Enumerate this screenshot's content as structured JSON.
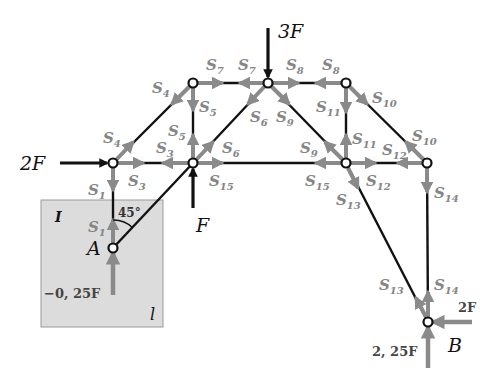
{
  "diagram": {
    "type": "truss free-body diagram",
    "colors": {
      "member": "#111111",
      "force_arrow": "#8a8a8a",
      "load": "#111111",
      "cutout_box": "#dcdcdc"
    },
    "nodes": [
      {
        "id": "A",
        "label": "A",
        "x": 113,
        "y": 248
      },
      {
        "id": "N1",
        "x": 113,
        "y": 163
      },
      {
        "id": "N2",
        "x": 193,
        "y": 163
      },
      {
        "id": "N3",
        "x": 193,
        "y": 83
      },
      {
        "id": "N4",
        "x": 268,
        "y": 83
      },
      {
        "id": "N5",
        "x": 346,
        "y": 83
      },
      {
        "id": "N6",
        "x": 346,
        "y": 163
      },
      {
        "id": "N7",
        "x": 427,
        "y": 163
      },
      {
        "id": "B",
        "label": "B",
        "x": 428,
        "y": 322
      }
    ],
    "members": [
      {
        "name": "S1",
        "from": "N1",
        "to": "A"
      },
      {
        "name": "S2",
        "from": "A",
        "to": "N2"
      },
      {
        "name": "S3",
        "from": "N1",
        "to": "N2"
      },
      {
        "name": "S4",
        "from": "N1",
        "to": "N3"
      },
      {
        "name": "S5",
        "from": "N3",
        "to": "N2"
      },
      {
        "name": "S6",
        "from": "N2",
        "to": "N4"
      },
      {
        "name": "S7",
        "from": "N3",
        "to": "N4"
      },
      {
        "name": "S8",
        "from": "N4",
        "to": "N5"
      },
      {
        "name": "S9",
        "from": "N4",
        "to": "N6"
      },
      {
        "name": "S10",
        "from": "N5",
        "to": "N7"
      },
      {
        "name": "S11",
        "from": "N5",
        "to": "N6"
      },
      {
        "name": "S12",
        "from": "N6",
        "to": "N7"
      },
      {
        "name": "S13",
        "from": "N6",
        "to": "B"
      },
      {
        "name": "S14",
        "from": "N7",
        "to": "B"
      },
      {
        "name": "S15",
        "from": "N2",
        "to": "N6"
      }
    ],
    "member_labels": {
      "s1a": {
        "base": "S",
        "sub": "1"
      },
      "s1b": {
        "base": "S",
        "sub": "1"
      },
      "s3a": {
        "base": "S",
        "sub": "3"
      },
      "s3b": {
        "base": "S",
        "sub": "3"
      },
      "s4a": {
        "base": "S",
        "sub": "4"
      },
      "s4b": {
        "base": "S",
        "sub": "4"
      },
      "s5a": {
        "base": "S",
        "sub": "5"
      },
      "s5b": {
        "base": "S",
        "sub": "5"
      },
      "s6a": {
        "base": "S",
        "sub": "6"
      },
      "s6b": {
        "base": "S",
        "sub": "6"
      },
      "s7a": {
        "base": "S",
        "sub": "7"
      },
      "s7b": {
        "base": "S",
        "sub": "7"
      },
      "s8a": {
        "base": "S",
        "sub": "8"
      },
      "s8b": {
        "base": "S",
        "sub": "8"
      },
      "s9a": {
        "base": "S",
        "sub": "9"
      },
      "s9b": {
        "base": "S",
        "sub": "9"
      },
      "s10a": {
        "base": "S",
        "sub": "10"
      },
      "s10b": {
        "base": "S",
        "sub": "10"
      },
      "s11a": {
        "base": "S",
        "sub": "11"
      },
      "s11b": {
        "base": "S",
        "sub": "11"
      },
      "s12a": {
        "base": "S",
        "sub": "12"
      },
      "s12b": {
        "base": "S",
        "sub": "12"
      },
      "s13a": {
        "base": "S",
        "sub": "13"
      },
      "s13b": {
        "base": "S",
        "sub": "13"
      },
      "s14a": {
        "base": "S",
        "sub": "14"
      },
      "s14b": {
        "base": "S",
        "sub": "14"
      },
      "s15a": {
        "base": "S",
        "sub": "15"
      },
      "s15b": {
        "base": "S",
        "sub": "15"
      }
    },
    "loads": {
      "top": "3F",
      "left": "2F",
      "bottom_mid": "F"
    },
    "reactions": {
      "A_vertical": "−0, 25F",
      "B_vertical": "2, 25F",
      "B_horizontal": "2F"
    },
    "support_labels": {
      "A": "A",
      "B": "B"
    },
    "angle": "45°",
    "cutout_box": {
      "corner_mark": "I",
      "length_label": "l"
    }
  }
}
